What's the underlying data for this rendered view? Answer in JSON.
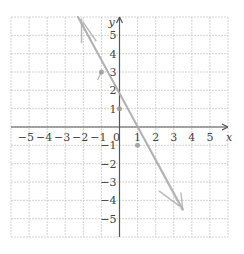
{
  "chart_data": {
    "type": "line",
    "title": "",
    "xlabel": "x",
    "ylabel": "y",
    "xlim": [
      -6,
      6
    ],
    "ylim": [
      -6,
      6
    ],
    "grid": true,
    "grid_style": "dashed",
    "x_ticks": [
      -5,
      -4,
      -3,
      -2,
      -1,
      0,
      1,
      2,
      3,
      4,
      5
    ],
    "y_ticks": [
      -5,
      -4,
      -3,
      -2,
      -1,
      1,
      2,
      3,
      4,
      5
    ],
    "x_tick_labels": [
      "−5",
      "−4",
      "−3",
      "−2",
      "−1",
      "0",
      "1",
      "2",
      "3",
      "4",
      "5"
    ],
    "y_tick_labels": [
      "−5",
      "−4",
      "−3",
      "−2",
      "−1",
      "1",
      "2",
      "3",
      "4",
      "5"
    ],
    "series": [
      {
        "name": "hand-drawn line",
        "equation": "y = -2x + 1",
        "x": [
          -2.3,
          3.5
        ],
        "y": [
          6,
          -4.5
        ],
        "style": "hand-drawn pencil"
      }
    ],
    "points": [
      {
        "x": -1,
        "y": 3
      },
      {
        "x": 0,
        "y": 1
      },
      {
        "x": 1,
        "y": -1
      }
    ],
    "sketch_marks": [
      {
        "from": [
          -2.1,
          5.9
        ],
        "to": [
          -2.1,
          4.6
        ]
      },
      {
        "from": [
          -2.0,
          5.7
        ],
        "to": [
          -1.3,
          4.7
        ]
      },
      {
        "from": [
          -1.0,
          3.0
        ],
        "to": [
          -1.2,
          2.6
        ]
      },
      {
        "from": [
          2.2,
          -3.5
        ],
        "to": [
          3.3,
          -4.3
        ]
      },
      {
        "from": [
          3.4,
          -3.6
        ],
        "to": [
          3.5,
          -4.5
        ]
      }
    ]
  },
  "colors": {
    "axis": "#555555",
    "grid": "#c8c8c8",
    "line": "#a9a9a9",
    "point": "#9a9a9a",
    "text": "#444444"
  }
}
